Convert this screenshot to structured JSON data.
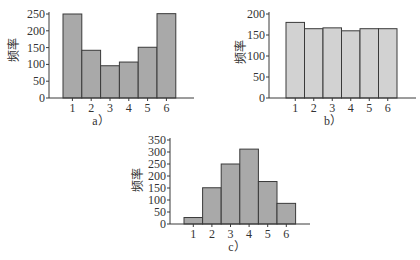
{
  "chart_data": [
    {
      "id": "a",
      "type": "bar",
      "caption": "a）",
      "title": "",
      "xlabel": "",
      "ylabel": "频率",
      "categories": [
        "1",
        "2",
        "3",
        "4",
        "5",
        "6"
      ],
      "values": [
        250,
        142,
        96,
        107,
        151,
        251
      ],
      "ylim": [
        0,
        250
      ],
      "yticks": [
        0,
        50,
        100,
        150,
        200,
        250
      ],
      "grid": false,
      "bar_color": "#a9a9a9",
      "layout": {
        "axis_x": 49,
        "axis_right": 194,
        "base_y": 98,
        "top_y": 14,
        "bar_start": 63,
        "bar_width": 18.8,
        "label_x": 14,
        "label_y": 50,
        "caption_x": 101,
        "caption_y": 125
      }
    },
    {
      "id": "b",
      "type": "bar",
      "caption": "b）",
      "title": "",
      "xlabel": "",
      "ylabel": "频率",
      "categories": [
        "1",
        "2",
        "3",
        "4",
        "5",
        "6"
      ],
      "values": [
        180,
        165,
        167,
        160,
        165,
        165
      ],
      "ylim": [
        0,
        200
      ],
      "yticks": [
        0,
        50,
        100,
        150,
        200
      ],
      "grid": false,
      "bar_color": "#d2d2d2",
      "layout": {
        "axis_x": 269,
        "axis_right": 416,
        "base_y": 98,
        "top_y": 14,
        "bar_start": 286,
        "bar_width": 18.5,
        "label_x": 241,
        "label_y": 52,
        "caption_x": 333,
        "caption_y": 125
      }
    },
    {
      "id": "c",
      "type": "bar",
      "caption": "c）",
      "title": "",
      "xlabel": "",
      "ylabel": "频率",
      "categories": [
        "1",
        "2",
        "3",
        "4",
        "5",
        "6"
      ],
      "values": [
        27,
        151,
        250,
        312,
        177,
        86
      ],
      "ylim": [
        0,
        350
      ],
      "yticks": [
        0,
        50,
        100,
        150,
        200,
        250,
        300,
        350
      ],
      "grid": false,
      "bar_color": "#a9a9a9",
      "layout": {
        "axis_x": 170,
        "axis_right": 310,
        "base_y": 224,
        "top_y": 140,
        "bar_start": 184,
        "bar_width": 18.6,
        "label_x": 138,
        "label_y": 180,
        "caption_x": 237,
        "caption_y": 251
      }
    }
  ]
}
